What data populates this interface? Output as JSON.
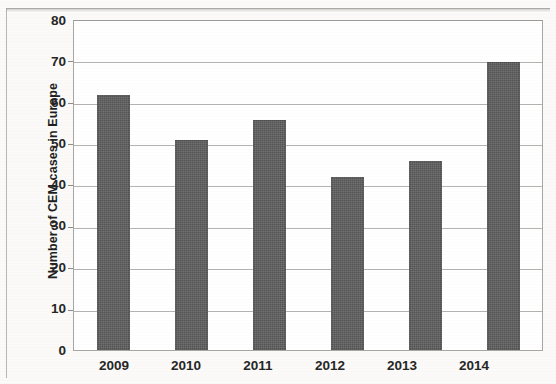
{
  "chart_data": {
    "type": "bar",
    "title": "",
    "subtitle": "",
    "xlabel": "",
    "ylabel": "Number of CEM cases in Europe",
    "categories": [
      "2009",
      "2010",
      "2011",
      "2012",
      "2013",
      "2014"
    ],
    "values": [
      62,
      51,
      56,
      42,
      46,
      70
    ],
    "series": [
      {
        "name": "CEM cases",
        "values": [
          62,
          51,
          56,
          42,
          46,
          70
        ]
      }
    ],
    "ylim": [
      0,
      80
    ],
    "ytick_labels": [
      "0",
      "10",
      "20",
      "30",
      "40",
      "50",
      "60",
      "70",
      "80"
    ],
    "ytick_values": [
      0,
      10,
      20,
      30,
      40,
      50,
      60,
      70,
      80
    ],
    "grid": "horizontal",
    "legend": "none",
    "bar_color": "#5d5d5d",
    "plot_background": "#ffffff",
    "axis_color": "#a9a7a3",
    "gridline_color": "#b6b4b0",
    "text_color": "#262626"
  }
}
